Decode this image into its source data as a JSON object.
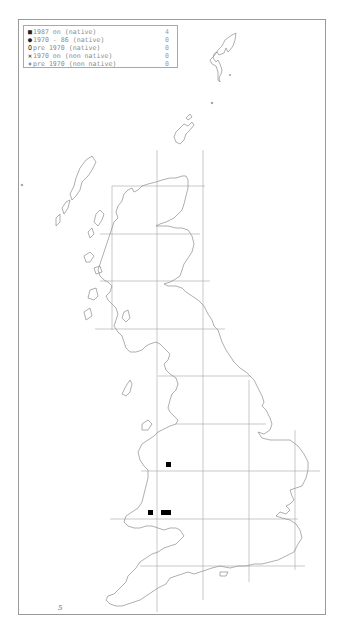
{
  "map": {
    "title": "Species distribution map — Great Britain",
    "grid_spacing_km": 100,
    "frame": {
      "x": 18,
      "y": 19,
      "w": 308,
      "h": 596
    }
  },
  "legend": {
    "items": [
      {
        "symbol": "filled-square",
        "glyph": "■",
        "label": "1987 on (native)",
        "count": "4"
      },
      {
        "symbol": "filled-circle",
        "glyph": "●",
        "label": "1970 - 86 (native)",
        "count": "0"
      },
      {
        "symbol": "open-circle",
        "glyph": "O",
        "label": "pre 1970 (native)",
        "count": "0"
      },
      {
        "symbol": "cross",
        "glyph": "✕",
        "label": "1970 on (non native)",
        "count": "0"
      },
      {
        "symbol": "plus",
        "glyph": "+",
        "label": "pre 1970 (non native)",
        "count": "0"
      }
    ]
  },
  "scilly_marker": "5",
  "records": [
    {
      "category": "1987 on (native)",
      "x": 166,
      "y": 462
    },
    {
      "category": "1987 on (native)",
      "x": 148,
      "y": 510
    },
    {
      "category": "1987 on (native)",
      "x": 161,
      "y": 510
    },
    {
      "category": "1987 on (native)",
      "x": 166,
      "y": 510
    }
  ],
  "colors": {
    "coast": "#8c8c8c",
    "grid": "#a0a0a0",
    "frame": "#9a9a9a",
    "record": "#000000"
  }
}
